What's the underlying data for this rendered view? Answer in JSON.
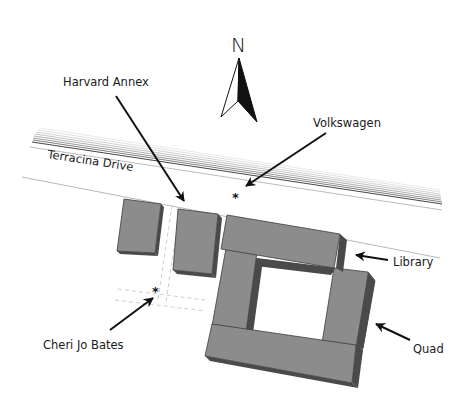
{
  "map": {
    "compass": {
      "label": "N"
    },
    "road": {
      "name": "Terracina Drive"
    },
    "labels": {
      "harvard_annex": "Harvard Annex",
      "volkswagen": "Volkswagen",
      "library": "Library",
      "quad": "Quad",
      "cheri_jo_bates": "Cheri Jo Bates"
    },
    "markers": [
      {
        "id": "volkswagen",
        "symbol": "*"
      },
      {
        "id": "cheri_jo_bates",
        "symbol": "*"
      }
    ],
    "colors": {
      "building_top": "#8c8c8c",
      "building_side": "#4a4a4a",
      "building_edge": "#3c3c3c",
      "ink": "#111111",
      "road_line": "#bdbdbd",
      "path_dash": "#c8c8c8"
    }
  }
}
